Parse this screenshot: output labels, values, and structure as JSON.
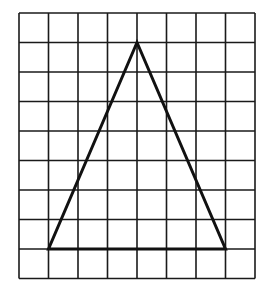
{
  "figure": {
    "grid": {
      "columns": 8,
      "rows": 9,
      "origin_px": [
        19,
        13
      ],
      "cell_px": 29.5,
      "line_color": "#1a1a1a"
    },
    "triangle": {
      "vertices_grid": [
        [
          4,
          1
        ],
        [
          1,
          8
        ],
        [
          7,
          8
        ]
      ],
      "stroke_color": "#111111",
      "base_cells": 6,
      "height_cells": 7
    }
  }
}
